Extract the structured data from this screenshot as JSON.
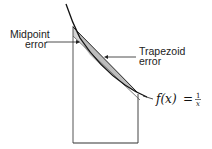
{
  "diagram": {
    "type": "trapezoid-vs-midpoint-error",
    "labels": {
      "midpoint_line1": "Midpoint",
      "midpoint_line2": "error",
      "trapezoid_line1": "Trapezoid",
      "trapezoid_line2": "error"
    },
    "formula": {
      "lhs": "f(x)",
      "eq": "=",
      "numerator": "1",
      "denominator": "x"
    },
    "colors": {
      "stroke": "#222222",
      "shade": "#bdbdbd",
      "background": "#ffffff"
    }
  }
}
